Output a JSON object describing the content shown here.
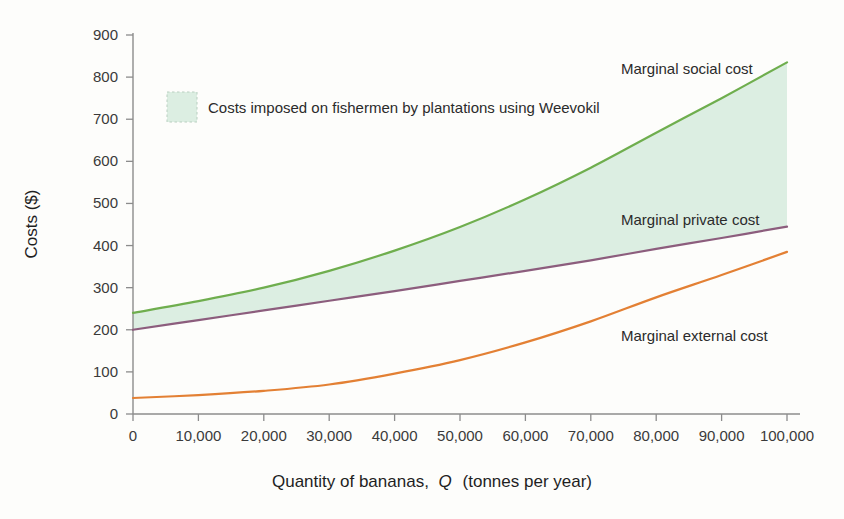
{
  "chart_data": {
    "type": "line",
    "title": "",
    "xlabel": "Quantity of bananas, Q (tonnes per year)",
    "xlabel_plain": "Quantity of bananas,",
    "xlabel_italic": "Q",
    "xlabel_tail": "(tonnes per year)",
    "ylabel": "Costs ($)",
    "xlim": [
      0,
      100000
    ],
    "ylim": [
      0,
      900
    ],
    "grid": false,
    "legend_position": "top-left-inside",
    "x_ticks": [
      "0",
      "10,000",
      "20,000",
      "30,000",
      "40,000",
      "50,000",
      "60,000",
      "70,000",
      "80,000",
      "90,000",
      "100,000"
    ],
    "x_tick_values": [
      0,
      10000,
      20000,
      30000,
      40000,
      50000,
      60000,
      70000,
      80000,
      90000,
      100000
    ],
    "y_ticks": [
      "0",
      "100",
      "200",
      "300",
      "400",
      "500",
      "600",
      "700",
      "800",
      "900"
    ],
    "y_tick_values": [
      0,
      100,
      200,
      300,
      400,
      500,
      600,
      700,
      800,
      900
    ],
    "x": [
      0,
      10000,
      20000,
      30000,
      40000,
      50000,
      60000,
      70000,
      80000,
      90000,
      100000
    ],
    "series": [
      {
        "name": "Marginal social cost",
        "color": "#6fae4e",
        "label_text": "Marginal social cost",
        "values": [
          240,
          268,
          300,
          340,
          388,
          444,
          510,
          585,
          668,
          750,
          835
        ]
      },
      {
        "name": "Marginal private cost",
        "color": "#8c5d7d",
        "label_text": "Marginal private cost",
        "values": [
          200,
          223,
          246,
          269,
          292,
          316,
          340,
          365,
          392,
          418,
          445
        ]
      },
      {
        "name": "Marginal external cost",
        "color": "#e38034",
        "label_text": "Marginal external cost",
        "values": [
          38,
          45,
          55,
          70,
          96,
          128,
          170,
          220,
          277,
          330,
          385
        ]
      }
    ],
    "shaded_region": {
      "label": "Costs imposed on fishermen by plantations using Weevokil",
      "fill_color": "#dceee2",
      "between": [
        "Marginal private cost",
        "Marginal social cost"
      ]
    },
    "annotations": [
      {
        "text": "Marginal social cost",
        "x": 88000,
        "y": 860
      },
      {
        "text": "Marginal private cost",
        "x": 88000,
        "y": 500
      },
      {
        "text": "Marginal external cost",
        "x": 84000,
        "y": 250
      }
    ]
  },
  "legend": {
    "swatch_name": "shaded-area-swatch",
    "text": "Costs imposed on fishermen by plantations using Weevokil"
  },
  "axes": {
    "y_title": "Costs ($)",
    "x_title_plain": "Quantity of bananas,",
    "x_title_italic": "Q",
    "x_title_tail": "(tonnes per year)"
  },
  "colors": {
    "social": "#6fae4e",
    "private": "#8c5d7d",
    "external": "#e38034",
    "fill": "#dceee2",
    "axis": "#8c8c8c",
    "background": "#fdfdfb"
  }
}
